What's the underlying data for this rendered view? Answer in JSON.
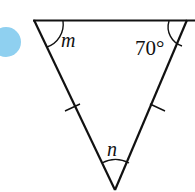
{
  "diagram": {
    "type": "isosceles-triangle",
    "labels": {
      "top_left_angle": "m",
      "top_right_angle": "70°",
      "bottom_angle": "n"
    },
    "colors": {
      "stroke": "#111111",
      "marker_circle": "#8fd0f0",
      "background": "#ffffff"
    },
    "equal_sides": [
      "left",
      "right"
    ]
  }
}
